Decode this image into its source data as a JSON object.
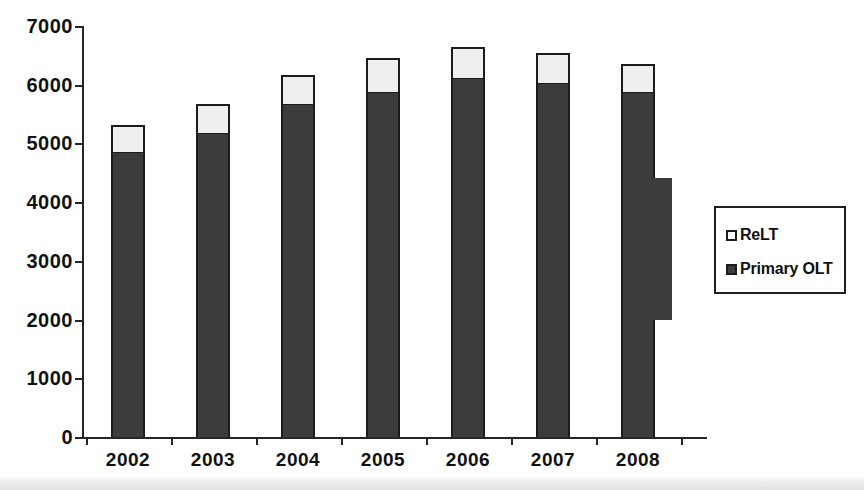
{
  "chart_data": {
    "type": "bar",
    "subtype": "stacked-vertical",
    "title": "",
    "xlabel": "",
    "ylabel": "",
    "categories": [
      "2002",
      "2003",
      "2004",
      "2005",
      "2006",
      "2007",
      "2008"
    ],
    "series": [
      {
        "name": "Primary OLT",
        "color": "#3c3c3c",
        "values": [
          4850,
          5180,
          5680,
          5880,
          6120,
          6030,
          5870
        ]
      },
      {
        "name": "ReLT",
        "color": "#efefef",
        "values": [
          470,
          490,
          480,
          580,
          530,
          510,
          480
        ]
      }
    ],
    "totals": [
      5320,
      5670,
      6160,
      6460,
      6650,
      6540,
      6350
    ],
    "ylim": [
      0,
      7000
    ],
    "y_ticks": [
      0,
      1000,
      2000,
      3000,
      4000,
      5000,
      6000,
      7000
    ],
    "y_tick_labels": [
      "0",
      "1000",
      "2000",
      "3000",
      "4000",
      "5000",
      "6000",
      "7000"
    ],
    "grid": false,
    "legend_position": "right",
    "legend_entries": [
      {
        "label": "ReLT",
        "swatch": "light"
      },
      {
        "label": "Primary OLT",
        "swatch": "dark"
      }
    ]
  },
  "axes": {
    "y": {
      "ticks": [
        {
          "value": 7000,
          "label": "7000"
        },
        {
          "value": 6000,
          "label": "6000"
        },
        {
          "value": 5000,
          "label": "5000"
        },
        {
          "value": 4000,
          "label": "4000"
        },
        {
          "value": 3000,
          "label": "3000"
        },
        {
          "value": 2000,
          "label": "2000"
        },
        {
          "value": 1000,
          "label": "1000"
        },
        {
          "value": 0,
          "label": "0"
        }
      ]
    },
    "x": {
      "ticks": [
        {
          "label": "2002"
        },
        {
          "label": "2003"
        },
        {
          "label": "2004"
        },
        {
          "label": "2005"
        },
        {
          "label": "2006"
        },
        {
          "label": "2007"
        },
        {
          "label": "2008"
        }
      ]
    }
  },
  "legend": {
    "items": [
      {
        "label": "ReLT"
      },
      {
        "label": "Primary OLT"
      }
    ]
  },
  "colors": {
    "primary_olt": "#3c3c3c",
    "relt": "#efefef",
    "outline": "#1c1c1c",
    "axis": "#262626",
    "text": "#111111",
    "background": "#ffffff"
  }
}
